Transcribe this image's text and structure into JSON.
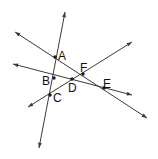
{
  "figure": {
    "width": 158,
    "height": 159,
    "background_color": "#ffffff",
    "line_color": "#3a3a3a",
    "point_color": "#1c1c1c",
    "label_color": "#111111"
  },
  "labels": [
    {
      "id": "A",
      "text": "A",
      "x": 58,
      "y": 50
    },
    {
      "id": "B",
      "text": "B",
      "x": 42,
      "y": 75
    },
    {
      "id": "C",
      "text": "C",
      "x": 53,
      "y": 92
    },
    {
      "id": "D",
      "text": "D",
      "x": 68,
      "y": 82
    },
    {
      "id": "E",
      "text": "E",
      "x": 103,
      "y": 78
    },
    {
      "id": "F",
      "text": "F",
      "x": 80,
      "y": 62
    }
  ],
  "points": [
    {
      "id": "A",
      "x": 55,
      "y": 57
    },
    {
      "id": "B",
      "x": 54,
      "y": 78
    },
    {
      "id": "C",
      "x": 50,
      "y": 95
    },
    {
      "id": "D",
      "x": 72,
      "y": 79
    },
    {
      "id": "E",
      "x": 104,
      "y": 88
    },
    {
      "id": "F",
      "x": 83,
      "y": 74
    }
  ],
  "lines": [
    {
      "id": "line-1",
      "name": "steep-line-A-B-C",
      "x1": 65,
      "y1": 12,
      "x2": 39,
      "y2": 148,
      "arrow_start": true,
      "arrow_end": true,
      "through": [
        "A",
        "B",
        "C"
      ]
    },
    {
      "id": "line-2",
      "name": "line-upperleft-to-lowerright",
      "x1": 15,
      "y1": 32,
      "x2": 147,
      "y2": 118,
      "arrow_start": true,
      "arrow_end": true,
      "through": [
        "A",
        "F"
      ]
    },
    {
      "id": "line-3",
      "name": "line-left-to-right",
      "x1": 13,
      "y1": 64,
      "x2": 132,
      "y2": 95,
      "arrow_start": true,
      "arrow_end": true,
      "through": [
        "B",
        "D",
        "E"
      ]
    },
    {
      "id": "line-4",
      "name": "line-lowerleft-to-upperright",
      "x1": 28,
      "y1": 107,
      "x2": 132,
      "y2": 42,
      "arrow_start": true,
      "arrow_end": true,
      "through": [
        "C",
        "D",
        "F",
        "E"
      ]
    }
  ]
}
